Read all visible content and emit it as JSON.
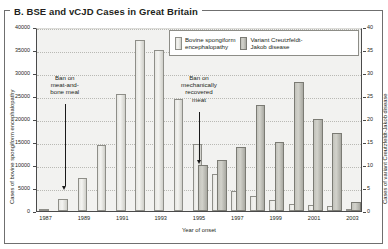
{
  "figure": {
    "title": "B. BSE and vCJD Cases in Great Britain"
  },
  "legend": {
    "items": [
      {
        "label": "Bovine spongiform\nencephalopathy",
        "key": "bse",
        "color": "#e2e2dd"
      },
      {
        "label": "Variant Creutzfeldt-\nJakob disease",
        "key": "vcjd",
        "color": "#c2c2bb"
      }
    ]
  },
  "annotations": [
    {
      "text": "Ban on\nmeat-and-\nbone meal",
      "year": 1988
    },
    {
      "text": "Ban on\nmechanically\nrecovered\nmeat",
      "year": 1995
    }
  ],
  "chart_data": {
    "type": "bar",
    "title": "B. BSE and vCJD Cases in Great Britain",
    "xlabel": "Year of onset",
    "ylabel": "Cases of bovine spongiform encephalopathy",
    "ylabel_right": "Cases of variant Creutzfeldt-Jakob disease",
    "grid": true,
    "legend_position": "top-right-inside",
    "categories": [
      1987,
      1988,
      1989,
      1990,
      1991,
      1992,
      1993,
      1994,
      1995,
      1996,
      1997,
      1998,
      1999,
      2000,
      2001,
      2002,
      2003
    ],
    "x_tick_labels": [
      "1987",
      "",
      "1989",
      "",
      "1991",
      "",
      "1993",
      "",
      "1995",
      "",
      "1997",
      "",
      "1999",
      "",
      "2001",
      "",
      "2003"
    ],
    "ylim": [
      0,
      40000
    ],
    "y_ticks": [
      0,
      5000,
      10000,
      15000,
      20000,
      25000,
      30000,
      35000,
      40000
    ],
    "y_tick_labels": [
      "0",
      "5000",
      "10000",
      "15000",
      "20000",
      "25000",
      "30000",
      "35000",
      "40000"
    ],
    "ylim_right": [
      0,
      40
    ],
    "y_ticks_right": [
      0,
      5,
      10,
      15,
      20,
      25,
      30,
      35,
      40
    ],
    "y_tick_labels_right": [
      "0",
      "5",
      "10",
      "15",
      "20",
      "25",
      "30",
      "35",
      "40"
    ],
    "series": [
      {
        "name": "Bovine spongiform encephalopathy",
        "axis": "left",
        "values": [
          446,
          2514,
          7228,
          14407,
          25359,
          37280,
          35090,
          24438,
          14562,
          8149,
          4393,
          3235,
          2301,
          1443,
          1202,
          1144,
          540
        ]
      },
      {
        "name": "Variant Creutzfeldt-Jakob disease",
        "axis": "right",
        "values": [
          0,
          0,
          0,
          0,
          0,
          0,
          0,
          0,
          10,
          11,
          14,
          23,
          15,
          28,
          20,
          17,
          2
        ]
      }
    ]
  }
}
